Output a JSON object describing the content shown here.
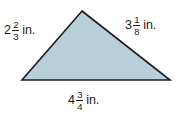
{
  "figure": {
    "type": "triangle-with-side-lengths",
    "background_color": "#ffffff",
    "fill_color": "#b8ced8",
    "stroke_color": "#1c1c1c",
    "stroke_width": 1.6,
    "vertices": {
      "apex": [
        82,
        11
      ],
      "bottom_left": [
        22,
        80
      ],
      "bottom_right": [
        170,
        80
      ]
    },
    "unit": "in."
  },
  "labels": {
    "left": {
      "name": "left-side-length",
      "whole": "2",
      "numerator": "2",
      "denominator": "3",
      "unit": "in.",
      "full_text": "2 2/3 in."
    },
    "right": {
      "name": "right-side-length",
      "whole": "3",
      "numerator": "1",
      "denominator": "8",
      "unit": "in.",
      "full_text": "3 1/8 in."
    },
    "bottom": {
      "name": "base-side-length",
      "whole": "4",
      "numerator": "3",
      "denominator": "4",
      "unit": "in.",
      "full_text": "4 3/4 in."
    }
  }
}
